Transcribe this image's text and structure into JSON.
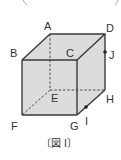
{
  "figure": {
    "caption": "〔図 I〕",
    "type": "cube",
    "colors": {
      "face_fill": "#dcdcdc",
      "edge": "#3a3a3a",
      "hidden_edge": "#3a3a3a",
      "label": "#333333"
    },
    "vertices": {
      "A": {
        "label": "A",
        "x": 50,
        "y": 34
      },
      "B": {
        "label": "B",
        "x": 22,
        "y": 60
      },
      "C": {
        "label": "C",
        "x": 77,
        "y": 60
      },
      "D": {
        "label": "D",
        "x": 105,
        "y": 34
      },
      "E": {
        "label": "E",
        "x": 50,
        "y": 90
      },
      "F": {
        "label": "F",
        "x": 22,
        "y": 115
      },
      "G": {
        "label": "G",
        "x": 77,
        "y": 115
      },
      "H": {
        "label": "H",
        "x": 105,
        "y": 90
      }
    },
    "points": {
      "I": {
        "label": "I",
        "x": 86,
        "y": 107,
        "on_edge": "GH"
      },
      "J": {
        "label": "J",
        "x": 105,
        "y": 52,
        "on_edge": "DH"
      }
    },
    "hidden_edges": [
      "AE",
      "EF",
      "EH"
    ]
  }
}
